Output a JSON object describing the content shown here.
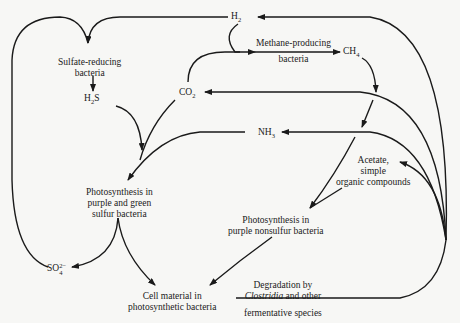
{
  "diagram": {
    "type": "microbial-sulfur-carbon-cycle",
    "nodes": {
      "h2": {
        "label": "H",
        "sub": "2"
      },
      "sulfate_reducing": {
        "line1": "Sulfate-reducing",
        "line2": "bacteria"
      },
      "h2s": {
        "label_a": "H",
        "sub": "2",
        "label_b": "S"
      },
      "co2": {
        "label": "CO",
        "sub": "2"
      },
      "methane_producing": {
        "line1": "Methane-producing",
        "line2": "bacteria"
      },
      "ch4": {
        "label": "CH",
        "sub": "4"
      },
      "nh3": {
        "label": "NH",
        "sub": "3"
      },
      "acetate": {
        "line1": "Acetate,",
        "line2": "simple",
        "line3": "organic compounds"
      },
      "photo_sulfur": {
        "line1": "Photosynthesis in",
        "line2": "purple and green",
        "line3": "sulfur bacteria"
      },
      "photo_nonsulfur": {
        "line1": "Photosynthesis in",
        "line2": "purple nonsulfur bacteria"
      },
      "so4": {
        "label": "SO",
        "sub": "4",
        "sup": "2−"
      },
      "cell_material": {
        "line1": "Cell material in",
        "line2": "photosynthetic bacteria"
      },
      "degradation": {
        "line1": "Degradation by",
        "line2_italic": "Clostridia",
        "line2_rest": " and other",
        "line3": "fermentative species"
      }
    },
    "edges": [
      {
        "from": "h2",
        "to": "sulfate_reducing"
      },
      {
        "from": "so4",
        "to": "sulfate_reducing"
      },
      {
        "from": "sulfate_reducing",
        "to": "h2s"
      },
      {
        "from": "h2",
        "to": "methane_producing"
      },
      {
        "from": "co2",
        "to": "methane_producing"
      },
      {
        "from": "methane_producing",
        "to": "ch4"
      },
      {
        "from": "ch4",
        "to": "photo_nonsulfur"
      },
      {
        "from": "h2s",
        "to": "photo_sulfur"
      },
      {
        "from": "co2",
        "to": "photo_sulfur"
      },
      {
        "from": "nh3",
        "to": "photo_sulfur"
      },
      {
        "from": "photo_sulfur",
        "to": "so4"
      },
      {
        "from": "photo_sulfur",
        "to": "cell_material"
      },
      {
        "from": "acetate",
        "to": "photo_nonsulfur"
      },
      {
        "from": "photo_nonsulfur",
        "to": "cell_material"
      },
      {
        "from": "degradation",
        "to": "h2"
      },
      {
        "from": "degradation",
        "to": "co2"
      },
      {
        "from": "degradation",
        "to": "nh3"
      },
      {
        "from": "degradation",
        "to": "acetate"
      }
    ],
    "colors": {
      "ink": "#1a1a1a",
      "background": "#f7f7f5"
    }
  }
}
